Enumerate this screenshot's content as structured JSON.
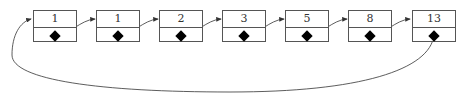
{
  "diagram": {
    "type": "circular-linked-list",
    "nodes": [
      {
        "value": "1"
      },
      {
        "value": "1"
      },
      {
        "value": "2"
      },
      {
        "value": "3"
      },
      {
        "value": "5"
      },
      {
        "value": "8"
      },
      {
        "value": "13"
      }
    ],
    "colors": {
      "line": "#333333",
      "border": "#555555",
      "pointer": "#000000"
    }
  }
}
